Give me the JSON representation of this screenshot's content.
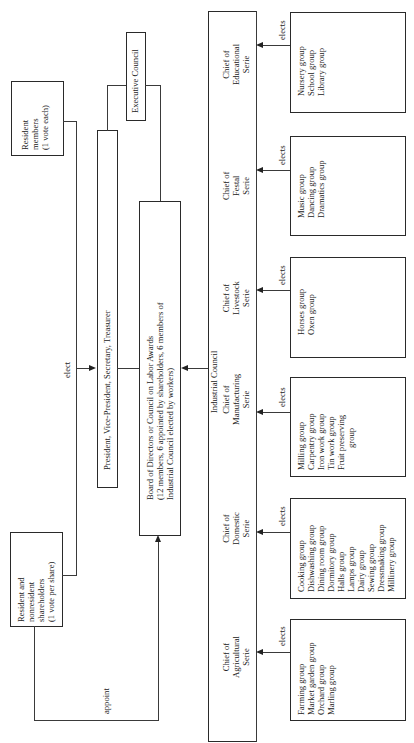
{
  "diagram": {
    "orientation": "rotated-90-ccw",
    "resident_members": {
      "lines": [
        "Resident",
        "members",
        "(1 vote each)"
      ]
    },
    "shareholders": {
      "lines": [
        "Resident and",
        "nonresident",
        "shareholders",
        "(1 vote per share)"
      ]
    },
    "edge_labels": {
      "elect": "elect",
      "appoint": "appoint",
      "elects": "elects"
    },
    "officers": {
      "label": "President, Vice-President, Secretary, Treasurer"
    },
    "executive_council": {
      "label": "Executive Council"
    },
    "board": {
      "lines": [
        "Board of Directors or Council on Labor Awards",
        "(12 members, 6 appointed by shareholders, 6 members of",
        "Industrial Council elected by workers)"
      ]
    },
    "industrial_council": {
      "label": "Industrial Council",
      "series": [
        {
          "chief": [
            "Chief of",
            "Educational",
            "Serie"
          ],
          "groups": [
            "Nursery group",
            "School group",
            "Library group"
          ]
        },
        {
          "chief": [
            "Chief of",
            "Festal",
            "Serie"
          ],
          "groups": [
            "Music group",
            "Dancing group",
            "Dramatics group"
          ]
        },
        {
          "chief": [
            "Chief of",
            "Livestock",
            "Serie"
          ],
          "groups": [
            "Horses group",
            "Oxen group"
          ]
        },
        {
          "chief": [
            "Chief of",
            "Manufacturing",
            "Serie"
          ],
          "groups": [
            "Milling group",
            "Carpentry group",
            "Iron work group",
            "Tin work group",
            "Fruit preserving",
            "group"
          ]
        },
        {
          "chief": [
            "Chief of",
            "Domestic",
            "Serie"
          ],
          "groups": [
            "Cooking group",
            "Dishwashing group",
            "Dining room group",
            "Dormitory group",
            "Halls group",
            "Lamps group",
            "Dairy group",
            "Sewing group",
            "Dressmaking group",
            "Millinery group"
          ]
        },
        {
          "chief": [
            "Chief of",
            "Agricultural",
            "Serie"
          ],
          "groups": [
            "Farming group",
            "Market garden group",
            "Orchard group",
            "Marling group"
          ]
        }
      ]
    }
  }
}
